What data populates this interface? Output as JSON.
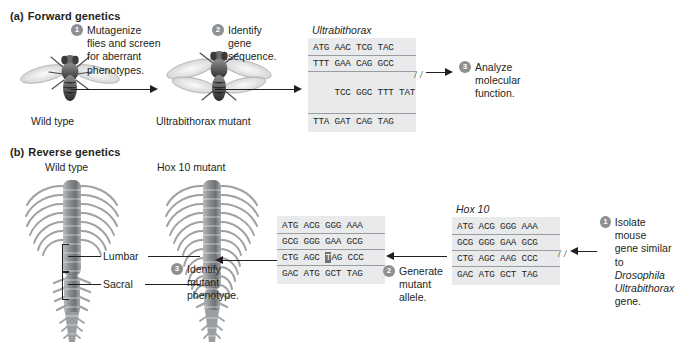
{
  "figure": {
    "panels": [
      {
        "id": "a",
        "label": "(a)",
        "title": "Forward genetics"
      },
      {
        "id": "b",
        "label": "(b)",
        "title": "Reverse genetics"
      }
    ]
  },
  "panel_a": {
    "label": "(a)",
    "title": "Forward genetics",
    "wild_type_label": "Wild type",
    "mutant_label_italic": "Ultrabithorax",
    "mutant_label_rest": " mutant",
    "step1": {
      "number": "1",
      "lines": [
        "Mutagenize",
        "flies and screen",
        "for aberrant",
        "phenotypes."
      ]
    },
    "step2": {
      "number": "2",
      "lines": [
        "Identify",
        "gene",
        "sequence."
      ]
    },
    "step3": {
      "number": "3",
      "lines": [
        "Analyze",
        "molecular",
        "function."
      ]
    },
    "sequence": {
      "gene_name": "Ultrabithorax",
      "lines": [
        "ATG AAC TCG TAC",
        "TTT GAA CAG GCC",
        "TCC GGC TTT TAT",
        "TTA GAT CAG TAG"
      ],
      "break_on_line": 3,
      "break_glyph": "/ /"
    }
  },
  "panel_b": {
    "label": "(b)",
    "title": "Reverse genetics",
    "wild_type_label": "Wild type",
    "mutant_label_italic": "Hox 10",
    "mutant_label_rest": " mutant",
    "region_labels": [
      "Lumbar",
      "Sacral"
    ],
    "step1": {
      "number": "1",
      "lines": [
        "Isolate mouse",
        "gene similar to",
        "Drosophila",
        "Ultrabithorax",
        "gene."
      ],
      "italic_lines": [
        2,
        3
      ]
    },
    "step2": {
      "number": "2",
      "lines": [
        "Generate",
        "mutant",
        "allele."
      ]
    },
    "step3": {
      "number": "3",
      "lines": [
        "Identify",
        "mutant",
        "phenotype."
      ]
    },
    "sequence_wildtype": {
      "gene_name": "Hox 10",
      "lines": [
        "ATG ACG GGG AAA",
        "GCG GGG GAA GCG",
        "CTG AGC AAG CCC",
        "GAC ATG GCT TAG"
      ],
      "break_on_line": 3,
      "break_glyph": "/ /"
    },
    "sequence_mutant": {
      "gene_name": "",
      "lines": [
        "ATG ACG GGG AAA",
        "GCG GGG GAA GCG",
        "CTG AGC TAG CCC",
        "GAC ATG GCT TAG"
      ],
      "mutation": {
        "line_index": 2,
        "prefix": "CTG AGC ",
        "mutated_base": "T",
        "suffix": "AG CCC"
      }
    }
  },
  "colors": {
    "badge_gray": "#8d8f92",
    "seq_box_gray": "#e9eaec",
    "seq_rule_gray": "#9a9c9f",
    "mutation_highlight": "#6f7173",
    "text": "#231f20",
    "background": "#ffffff"
  }
}
